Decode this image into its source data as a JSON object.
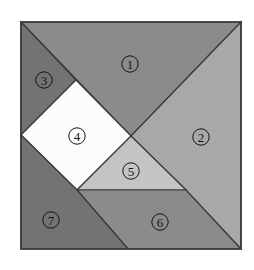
{
  "figure": {
    "background_color": "#ffffff",
    "outline_color": "#3a3a3a",
    "label_color": "#141414",
    "square": {
      "left": 21,
      "top": 22,
      "right": 241,
      "bottom": 249,
      "width": 220,
      "height": 227
    }
  },
  "pieces": [
    {
      "id": 1,
      "label": "①",
      "name": "large-triangle-top",
      "shape": "triangle",
      "color": "#8b8b8b",
      "points": "21,22 241,22 131,136",
      "label_x": 130,
      "label_y": 64
    },
    {
      "id": 2,
      "label": "②",
      "name": "large-triangle-right",
      "shape": "triangle",
      "color": "#a8a8a8",
      "points": "241,22 241,249 186,190 131,136",
      "label_x": 201,
      "label_y": 137
    },
    {
      "id": 3,
      "label": "③",
      "name": "small-triangle-top-left",
      "shape": "triangle",
      "color": "#737373",
      "points": "21,22 76,80 21,135",
      "label_x": 44,
      "label_y": 80
    },
    {
      "id": 4,
      "label": "④",
      "name": "square-center",
      "shape": "square",
      "color": "#fcfcfc",
      "points": "76,80 131,136 77,190 21,135",
      "label_x": 77,
      "label_y": 136
    },
    {
      "id": 5,
      "label": "⑤",
      "name": "small-triangle-center",
      "shape": "triangle",
      "color": "#c4c4c4",
      "points": "77,190 131,136 186,190",
      "label_x": 131,
      "label_y": 171
    },
    {
      "id": 6,
      "label": "⑥",
      "name": "medium-triangle-bottom",
      "shape": "triangle",
      "color": "#8b8b8b",
      "points": "77,190 186,190 241,249 128,249",
      "label_x": 160,
      "label_y": 222
    },
    {
      "id": 7,
      "label": "⑦",
      "name": "quadrilateral-bottom-left",
      "shape": "quadrilateral",
      "color": "#737373",
      "points": "21,135 77,190 128,249 21,249",
      "label_x": 51,
      "label_y": 220
    }
  ]
}
